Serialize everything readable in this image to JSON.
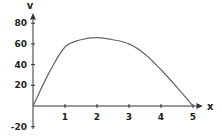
{
  "chart_data": {
    "type": "line",
    "title": "",
    "xlabel": "x",
    "ylabel": "v",
    "xlim": [
      0,
      5.3
    ],
    "ylim": [
      -20,
      90
    ],
    "x_ticks": [
      1,
      2,
      3,
      4,
      5
    ],
    "x_tick_labels": [
      "1",
      "2",
      "3",
      "4",
      "5"
    ],
    "y_ticks": [
      -20,
      20,
      40,
      60,
      80
    ],
    "y_tick_labels": [
      "-20",
      "20",
      "40",
      "60",
      "80"
    ],
    "grid": false,
    "legend": null,
    "series": [
      {
        "name": "v",
        "x": [
          0,
          0.5,
          1,
          1.5,
          2,
          2.5,
          3,
          3.5,
          4,
          4.5,
          5
        ],
        "values": [
          0,
          32,
          57,
          64,
          66,
          64,
          60,
          50,
          35,
          18,
          0
        ]
      }
    ],
    "colors": {
      "axis": "#333333",
      "curve": "#666666"
    }
  }
}
